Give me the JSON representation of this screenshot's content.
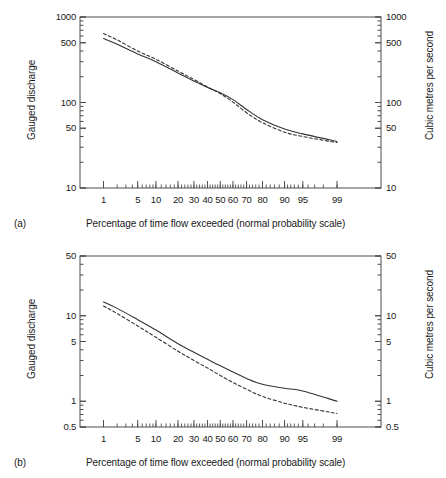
{
  "figure": {
    "panels": [
      {
        "letter": "(a)",
        "xlabel": "Percentage of time flow exceeded (normal probability scale)",
        "ylabel_left": "Gauged discharge",
        "ylabel_right": "Cubic metres per second"
      },
      {
        "letter": "(b)",
        "xlabel": "Percentage of time flow exceeded (normal probability scale)",
        "ylabel_left": "Gauged discharge",
        "ylabel_right": "Cubic metres per second"
      }
    ]
  },
  "chart_data": [
    {
      "type": "line",
      "panel": "(a)",
      "title": "",
      "xlabel": "Percentage of time flow exceeded (normal probability scale)",
      "ylabel": "Gauged discharge",
      "ylabel_right": "Cubic metres per second",
      "xscale": "normal-probability",
      "yscale": "log",
      "xlim": [
        0.5,
        99.5
      ],
      "ylim": [
        10,
        1000
      ],
      "xticks": [
        1,
        5,
        10,
        20,
        30,
        40,
        50,
        60,
        70,
        80,
        90,
        95,
        99
      ],
      "xticklabels": [
        "1",
        "5",
        "10",
        "20",
        "30",
        "40",
        "50",
        "60",
        "70",
        "80",
        "90",
        "95",
        "99"
      ],
      "yticks": [
        10,
        50,
        100,
        500,
        1000
      ],
      "yticklabels": [
        "10",
        "50",
        "100",
        "500",
        "1000"
      ],
      "yticks_right": [
        10,
        50,
        100,
        500,
        1000
      ],
      "yticklabels_right": [
        "10",
        "50",
        "100",
        "500",
        "1000"
      ],
      "grid": false,
      "legend": "none",
      "series": [
        {
          "name": "solid-curve",
          "style": "solid",
          "color": "#333333",
          "x": [
            1,
            2,
            5,
            10,
            20,
            30,
            40,
            50,
            60,
            70,
            80,
            90,
            95,
            99
          ],
          "y": [
            560,
            480,
            370,
            300,
            222,
            178,
            150,
            130,
            108,
            83,
            63,
            49,
            43,
            35
          ]
        },
        {
          "name": "dashed-curve",
          "style": "dashed",
          "color": "#333333",
          "x": [
            1,
            2,
            5,
            10,
            20,
            30,
            40,
            50,
            60,
            70,
            80,
            90,
            95,
            99
          ],
          "y": [
            640,
            540,
            400,
            320,
            233,
            186,
            152,
            127,
            101,
            76,
            58,
            45,
            40,
            34
          ]
        }
      ]
    },
    {
      "type": "line",
      "panel": "(b)",
      "title": "",
      "xlabel": "Percentage of time flow exceeded (normal probability scale)",
      "ylabel": "Gauged discharge",
      "ylabel_right": "Cubic metres per second",
      "xscale": "normal-probability",
      "yscale": "log",
      "xlim": [
        0.5,
        99.5
      ],
      "ylim": [
        0.5,
        50
      ],
      "xticks": [
        1,
        5,
        10,
        20,
        30,
        40,
        50,
        60,
        70,
        80,
        90,
        95,
        99
      ],
      "xticklabels": [
        "1",
        "5",
        "10",
        "20",
        "30",
        "40",
        "50",
        "60",
        "70",
        "80",
        "90",
        "95",
        "99"
      ],
      "yticks": [
        0.5,
        1,
        5,
        10,
        50
      ],
      "yticklabels": [
        "0.5",
        "1",
        "5",
        "10",
        "50"
      ],
      "yticks_right": [
        0.5,
        1,
        5,
        10,
        50
      ],
      "yticklabels_right": [
        "0.5",
        "1",
        "5",
        "10",
        "50"
      ],
      "grid": false,
      "legend": "none",
      "series": [
        {
          "name": "solid-curve",
          "style": "solid",
          "color": "#333333",
          "x": [
            1,
            2,
            5,
            10,
            20,
            30,
            40,
            50,
            60,
            70,
            80,
            90,
            95,
            99
          ],
          "y": [
            14.5,
            12.2,
            9.0,
            6.8,
            4.7,
            3.75,
            3.1,
            2.6,
            2.2,
            1.85,
            1.58,
            1.42,
            1.32,
            1.0
          ]
        },
        {
          "name": "dashed-curve",
          "style": "dashed",
          "color": "#333333",
          "x": [
            1,
            2,
            5,
            10,
            20,
            30,
            40,
            50,
            60,
            70,
            80,
            90,
            95,
            99
          ],
          "y": [
            13.0,
            10.6,
            7.6,
            5.6,
            3.85,
            3.0,
            2.45,
            2.0,
            1.66,
            1.38,
            1.14,
            0.95,
            0.85,
            0.72
          ]
        }
      ]
    }
  ],
  "colors": {
    "axis": "#4d4d4d",
    "curve": "#333333",
    "text": "#1a1a1a",
    "background": "#ffffff"
  }
}
